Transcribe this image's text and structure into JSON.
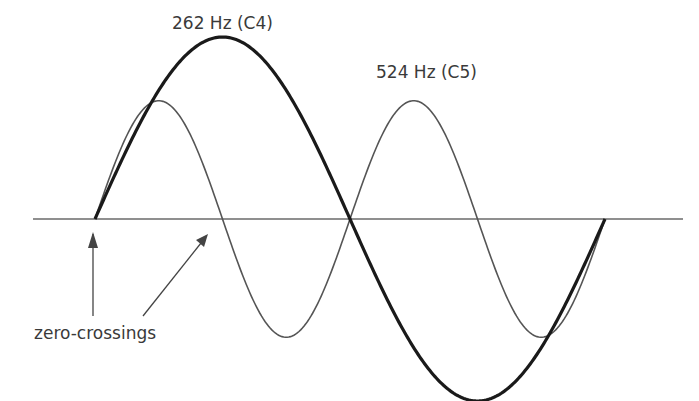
{
  "labels": {
    "c4": "262 Hz (C4)",
    "c5": "524 Hz (C5)",
    "zero_crossings": "zero-crossings"
  },
  "colors": {
    "axis": "#6a6a6a",
    "wave_c4": "#1a1a1a",
    "wave_c5": "#555555",
    "arrow": "#444444",
    "text": "#3a3a3a"
  },
  "waves": [
    {
      "name": "262 Hz (C4)",
      "frequency_hz": 262,
      "cycles_shown": 1,
      "stroke": "thick",
      "relative_amplitude": 1.0
    },
    {
      "name": "524 Hz (C5)",
      "frequency_hz": 524,
      "cycles_shown": 2,
      "stroke": "thin",
      "relative_amplitude": 0.65
    }
  ],
  "annotations": [
    {
      "text": "zero-crossings",
      "arrows": 2,
      "points_to": "zero crossings of the waves on the time axis"
    }
  ]
}
